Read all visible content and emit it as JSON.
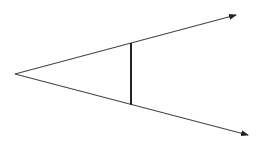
{
  "diagram": {
    "type": "angle-with-transversal",
    "background": "#ffffff",
    "stroke_color": "#333333",
    "vertex": {
      "x": 15,
      "y": 74
    },
    "rays": [
      {
        "name": "upper-ray",
        "from": {
          "x": 15,
          "y": 74
        },
        "to": {
          "x": 236,
          "y": 15
        },
        "arrow": true
      },
      {
        "name": "lower-ray",
        "from": {
          "x": 15,
          "y": 74
        },
        "to": {
          "x": 248,
          "y": 135
        },
        "arrow": true
      }
    ],
    "segment": {
      "name": "vertical-segment",
      "from": {
        "x": 131,
        "y": 43
      },
      "to": {
        "x": 131,
        "y": 105
      }
    }
  }
}
